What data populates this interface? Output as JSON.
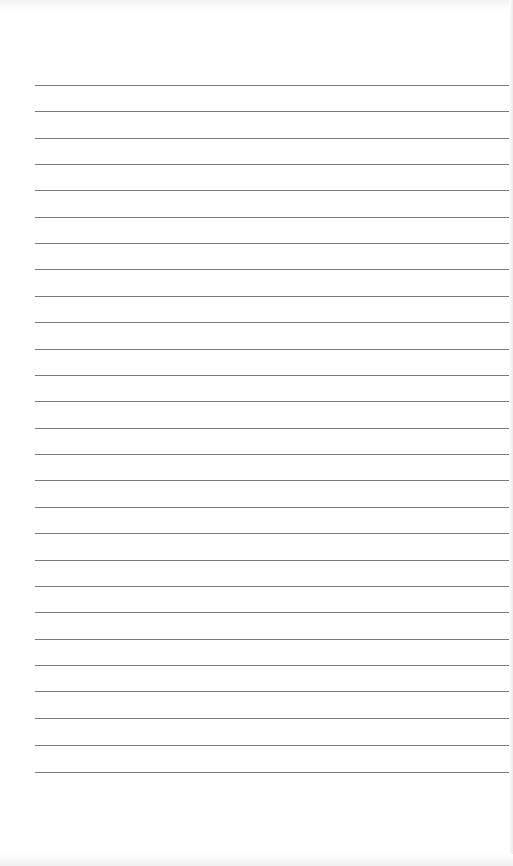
{
  "page": {
    "type": "lined-paper",
    "background_color": "#ffffff",
    "rule_color": "#7a7a7a",
    "rule_left_x": 35,
    "rule_count": 27,
    "rule_y_positions": [
      85,
      111,
      138,
      164,
      190,
      217,
      243,
      269,
      296,
      322,
      349,
      375,
      401,
      428,
      454,
      480,
      507,
      533,
      560,
      586,
      612,
      639,
      665,
      691,
      718,
      745,
      772
    ]
  }
}
